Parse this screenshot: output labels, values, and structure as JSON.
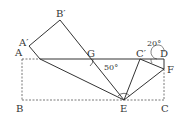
{
  "labels": {
    "A": "A",
    "A_prime": "A′",
    "B_prime": "B′",
    "G": "G",
    "C_prime": "C′",
    "D": "D",
    "F": "F",
    "B": "B",
    "E": "E",
    "C": "C"
  },
  "angles": {
    "at_G": "50°",
    "at_D": "20°"
  },
  "colors": {
    "stroke": "#333333",
    "dashed": "#555555"
  }
}
